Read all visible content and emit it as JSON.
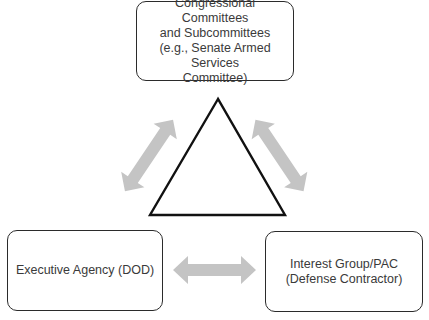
{
  "diagram": {
    "type": "iron-triangle",
    "nodes": {
      "top": {
        "lines": [
          "Congressional Committees",
          "and Subcommittees",
          "(e.g., Senate Armed Services",
          "Committee)"
        ]
      },
      "left": {
        "lines": [
          "Executive Agency (DOD)"
        ]
      },
      "right": {
        "lines": [
          "Interest Group/PAC",
          "(Defense Contractor)"
        ]
      }
    },
    "edges": [
      {
        "from": "top",
        "to": "left",
        "style": "bidirectional-arrow"
      },
      {
        "from": "top",
        "to": "right",
        "style": "bidirectional-arrow"
      },
      {
        "from": "left",
        "to": "right",
        "style": "bidirectional-arrow"
      }
    ],
    "colors": {
      "border": "#2b2b2b",
      "text": "#3a3a3a",
      "arrow": "#c4c4c4",
      "triangle": "#111111"
    }
  }
}
